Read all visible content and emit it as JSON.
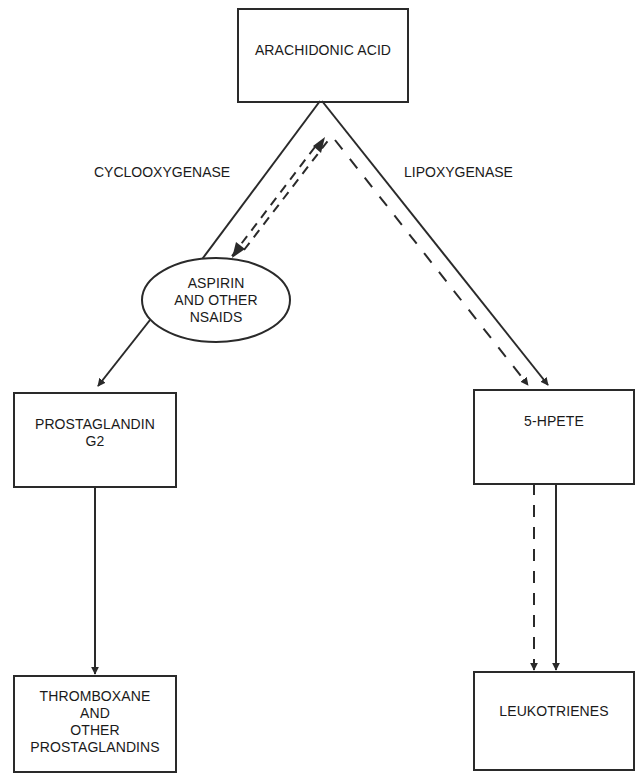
{
  "diagram": {
    "nodes": {
      "arachidonic_acid": "ARACHIDONIC ACID",
      "aspirin": [
        "ASPIRIN",
        "AND OTHER",
        "NSAIDS"
      ],
      "prostaglandin_g2": [
        "PROSTAGLANDIN",
        "G2"
      ],
      "hpete": "5-HPETE",
      "thromboxane": [
        "THROMBOXANE",
        "AND",
        "OTHER",
        "PROSTAGLANDINS"
      ],
      "leukotrienes": "LEUKOTRIENES"
    },
    "edges": {
      "cyclooxygenase": "CYCLOOXYGENASE",
      "lipoxygenase": "LIPOXYGENASE"
    },
    "colors": {
      "line": "#2a2a2a",
      "background": "#ffffff"
    }
  }
}
